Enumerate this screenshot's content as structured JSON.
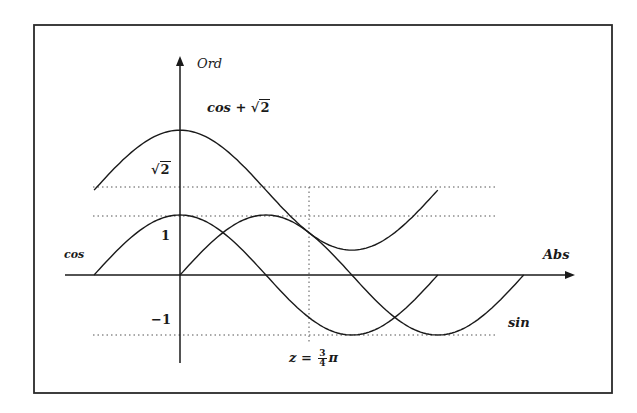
{
  "chart_data": {
    "type": "line",
    "title": "",
    "xlabel": "Abs",
    "ylabel": "Ord",
    "series": [
      {
        "name": "cos",
        "function": "cos(x)",
        "x_range": [
          "-pi/2",
          "3pi/2"
        ]
      },
      {
        "name": "sin",
        "function": "sin(x)",
        "x_range": [
          "0",
          "2pi"
        ]
      },
      {
        "name": "cos + √2",
        "function": "cos(x)+sqrt(2)",
        "x_range": [
          "-pi/2",
          "3pi/2"
        ]
      }
    ],
    "reference_lines": [
      {
        "type": "horizontal",
        "value": "√2",
        "style": "dotted"
      },
      {
        "type": "horizontal",
        "value": 1,
        "style": "dotted"
      },
      {
        "type": "horizontal",
        "value": -1,
        "style": "dotted"
      },
      {
        "type": "vertical",
        "value": "3/4 π",
        "style": "dotted"
      }
    ],
    "annotations": [
      "z = 3/4 π"
    ],
    "y_tick_labels": [
      "√2",
      "1",
      "−1"
    ],
    "grid": false,
    "legend": "inline labels"
  },
  "labels": {
    "ord": "Ord",
    "abs": "Abs",
    "cos": "cos",
    "sin": "sin",
    "cos_sqrt2_prefix": "cos + ",
    "sqrt_symbol": "√",
    "sqrt_value": "2",
    "tick_sqrt2_value": "2",
    "tick_one": "1",
    "tick_minus_one": "−1",
    "z_prefix": "z = ",
    "frac_num": "3",
    "frac_den": "4",
    "pi": "π"
  },
  "colors": {
    "ink": "#1a1a1a",
    "background": "#ffffff",
    "dotted": "#555555"
  }
}
